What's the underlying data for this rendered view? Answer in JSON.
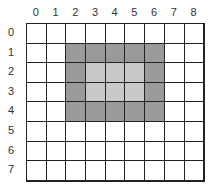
{
  "col_labels": [
    "0",
    "1",
    "2",
    "3",
    "4",
    "5",
    "6",
    "7",
    "8"
  ],
  "row_labels": [
    "0",
    "1",
    "2",
    "3",
    "4",
    "5",
    "6",
    "7"
  ],
  "colors": {
    "dark": "#9a9a9a",
    "light": "#c8c8c8",
    "empty": "#ffffff",
    "line": "#222222"
  },
  "cells": [
    [
      "w",
      "w",
      "w",
      "w",
      "w",
      "w",
      "w",
      "w",
      "w"
    ],
    [
      "w",
      "w",
      "d",
      "d",
      "d",
      "d",
      "d",
      "w",
      "w"
    ],
    [
      "w",
      "w",
      "d",
      "l",
      "l",
      "l",
      "d",
      "w",
      "w"
    ],
    [
      "w",
      "w",
      "d",
      "l",
      "l",
      "l",
      "d",
      "w",
      "w"
    ],
    [
      "w",
      "w",
      "d",
      "d",
      "d",
      "d",
      "d",
      "w",
      "w"
    ],
    [
      "w",
      "w",
      "w",
      "w",
      "w",
      "w",
      "w",
      "w",
      "w"
    ],
    [
      "w",
      "w",
      "w",
      "w",
      "w",
      "w",
      "w",
      "w",
      "w"
    ],
    [
      "w",
      "w",
      "w",
      "w",
      "w",
      "w",
      "w",
      "w",
      "w"
    ]
  ]
}
